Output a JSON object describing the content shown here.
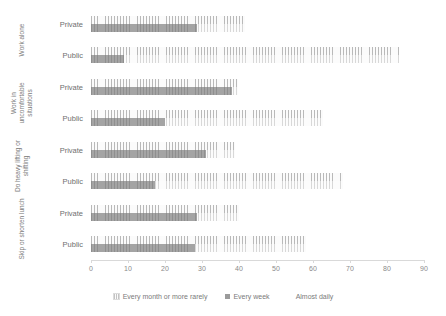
{
  "chart_data": {
    "type": "bar",
    "orientation": "horizontal",
    "stacked": true,
    "title": "",
    "xlabel": "",
    "ylabel": "",
    "xlim": [
      0,
      90
    ],
    "xticks": [
      0,
      10,
      20,
      30,
      40,
      50,
      60,
      70,
      80,
      90
    ],
    "grid": false,
    "legend_position": "bottom",
    "legend": [
      {
        "label": "Every month or more rarely",
        "swatch": "light-hatched",
        "color": "#f2f2f2"
      },
      {
        "label": "Every week",
        "swatch": "solid-grey",
        "color": "#9b9b9b"
      },
      {
        "label": "Almost daily",
        "swatch": "white",
        "color": "#ffffff"
      }
    ],
    "series": [
      {
        "name": "Every month or more rarely",
        "values": [
          41.7,
          83.2,
          39.6,
          62.6,
          39.0,
          68.0,
          40.0,
          58.0
        ]
      },
      {
        "name": "Every week",
        "values": [
          28.7,
          9.0,
          38.2,
          20.0,
          31.0,
          17.3,
          28.7,
          28.0
        ]
      },
      {
        "name": "Almost daily",
        "values": [
          0,
          0,
          0,
          0,
          0,
          0,
          0,
          0
        ]
      }
    ],
    "groups": [
      {
        "label": "Work alone",
        "categories": [
          {
            "label": "Private",
            "rarely": 41.7,
            "week": 28.7,
            "daily": 0
          },
          {
            "label": "Public",
            "rarely": 83.2,
            "week": 9.0,
            "daily": 0
          }
        ]
      },
      {
        "label": "Work in uncomfortable situations",
        "categories": [
          {
            "label": "Private",
            "rarely": 39.6,
            "week": 38.2,
            "daily": 0
          },
          {
            "label": "Public",
            "rarely": 62.6,
            "week": 20.0,
            "daily": 0
          }
        ]
      },
      {
        "label": "Do heavy lifting or shifting",
        "categories": [
          {
            "label": "Private",
            "rarely": 39.0,
            "week": 31.0,
            "daily": 0
          },
          {
            "label": "Public",
            "rarely": 68.0,
            "week": 17.3,
            "daily": 0
          }
        ]
      },
      {
        "label": "Skip or shorten lunch",
        "categories": [
          {
            "label": "Private",
            "rarely": 40.0,
            "week": 28.7,
            "daily": 0
          },
          {
            "label": "Public",
            "rarely": 58.0,
            "week": 28.0,
            "daily": 0
          }
        ]
      }
    ]
  },
  "colors": {
    "rarely": "#f2f2f2",
    "week": "#9b9b9b",
    "daily": "#ffffff",
    "axis": "#d9d9d9",
    "text": "#808080"
  }
}
